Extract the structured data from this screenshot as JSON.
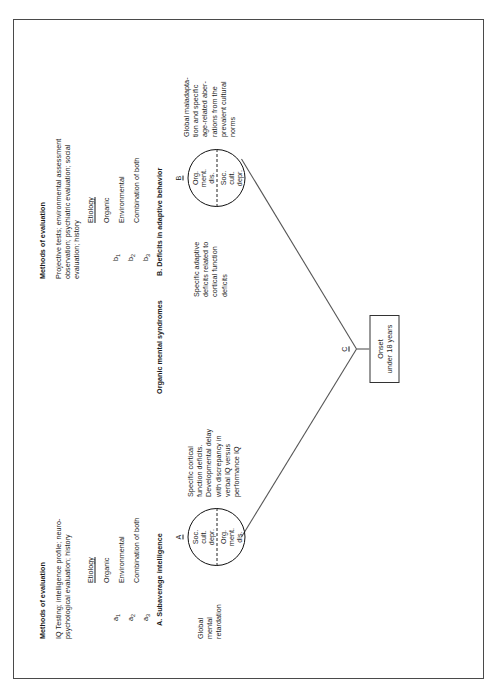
{
  "figure": {
    "type": "diagram"
  },
  "methods": {
    "heading_left": "Methods of evaluation",
    "text_left": "IQ Testing; intelligence profile; neuro-\npsychological evaluation; history",
    "heading_right": "Methods of evaluation",
    "text_right": "Projective tests; environmental assessment\nobservation; psychiatric evaluation; social\nevaluation; history"
  },
  "etiology_a": {
    "heading": "Etiology",
    "markers": [
      "a",
      "a",
      "a"
    ],
    "subscripts": [
      "1",
      "2",
      "3"
    ],
    "items": [
      "Organic",
      "Environmental",
      "Combination of both"
    ]
  },
  "etiology_b": {
    "heading": "Etiology",
    "markers": [
      "b",
      "b",
      "b"
    ],
    "subscripts": [
      "1",
      "2",
      "3"
    ],
    "items": [
      "Organic",
      "Environmental",
      "Combination of both"
    ]
  },
  "section_a": {
    "title": "A. Subaverage intelligence",
    "node_label": "A",
    "left_text": "Global\nmental\nretardation",
    "right_text": "Specific cortical\nfunction deficits.\nDevelopmental delay\nwith discrepancy in\nverbal IQ versus\nperformance IQ",
    "circle_top": "Soc.\ncult.\ndepr.",
    "circle_bottom": "Org.\nment.\ndis."
  },
  "section_b": {
    "title": "B. Deficits in adaptive behavior",
    "node_label": "B",
    "left_text": "Specific adaptive\ndeficits related to\ncortical function\ndeficits",
    "right_text": "Global maladapta-\ntion and specific\nage-related aber-\nrations from the\nprevalent cultural\nnorms",
    "circle_top": "Org.\nment.\ndis.",
    "circle_bottom": "Soc.\ncult.\ndepr."
  },
  "section_c": {
    "node_label": "C",
    "box_line1": "Onset",
    "box_line2": "under 18 years"
  },
  "center_label": "Organic mental syndromes",
  "colors": {
    "frame": "#4a4a4a",
    "ink": "#1b1b1b",
    "circle_stroke": "#111111",
    "connector": "#555555"
  }
}
